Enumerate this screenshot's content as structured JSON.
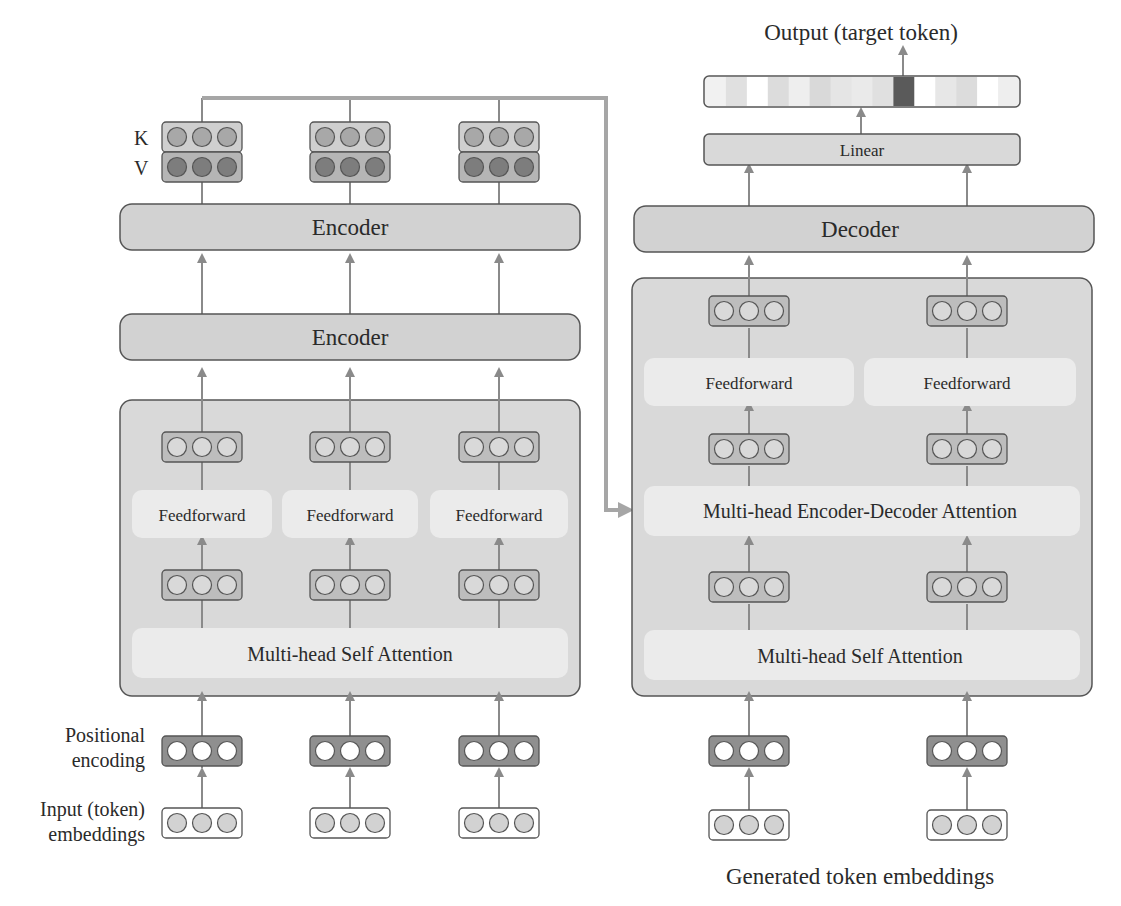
{
  "colors": {
    "line": "#8a8a8a",
    "box_border": "#555555",
    "block_fill": "#d2d2d2",
    "group_fill": "#d9d9d9",
    "sub_fill": "#ebebeb",
    "vec_fill": "#bdbdbd",
    "pos_fill": "#8f8f8f",
    "key_dot": "#a8a8a8",
    "value_dot": "#7d7d7d",
    "embed_dot": "#d2d2d2",
    "bridge": "#a6a6a6",
    "highlight_token": "#5a5a5a"
  },
  "encoder": {
    "columns_x": [
      202,
      350,
      499
    ],
    "kv": {
      "key_label": "K",
      "value_label": "V"
    },
    "blocks": [
      {
        "label": "Encoder"
      },
      {
        "label": "Encoder"
      }
    ],
    "sublayers": {
      "feedforward_label": "Feedforward",
      "self_attention_label": "Multi-head Self Attention"
    },
    "side_labels": {
      "positional_line1": "Positional",
      "positional_line2": "encoding",
      "input_line1": "Input (token)",
      "input_line2": "embeddings"
    }
  },
  "decoder": {
    "columns_x": [
      749,
      967
    ],
    "block": {
      "label": "Decoder"
    },
    "sublayers": {
      "feedforward_label": "Feedforward",
      "cross_attention_label": "Multi-head Encoder-Decoder Attention",
      "self_attention_label": "Multi-head Self Attention"
    },
    "linear_label": "Linear",
    "output_label": "Output (target token)",
    "bottom_label": "Generated token embeddings",
    "output_distribution": [
      0.08,
      0.18,
      0.0,
      0.2,
      0.1,
      0.22,
      0.15,
      0.12,
      0.18,
      0.9,
      0.0,
      0.14,
      0.2,
      0.0,
      0.1
    ]
  }
}
